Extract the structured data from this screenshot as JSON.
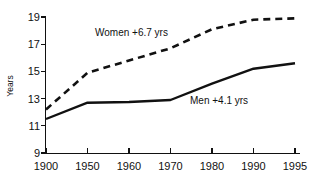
{
  "chart_data": {
    "type": "line",
    "title": "",
    "subtitle": "",
    "xlabel": "",
    "ylabel": "Years",
    "x": [
      "1900",
      "1950",
      "1960",
      "1970",
      "1980",
      "1990",
      "1995"
    ],
    "categories": [
      "1900",
      "1950",
      "1960",
      "1970",
      "1980",
      "1990",
      "1995"
    ],
    "xtick_labels": [
      "1900",
      "1950",
      "1960",
      "1970",
      "1980",
      "1990",
      "1995"
    ],
    "ytick_labels": [
      "9",
      "11",
      "13",
      "15",
      "17",
      "19"
    ],
    "yticks": [
      9,
      11,
      13,
      15,
      17,
      19
    ],
    "ylim": [
      9,
      19
    ],
    "grid": false,
    "legend_position": "inline-annotation",
    "series": [
      {
        "name": "Women",
        "style": "dashed",
        "color": "#111111",
        "annotation": "Women +6.7 yrs",
        "values": [
          12.2,
          14.9,
          15.8,
          16.7,
          18.1,
          18.8,
          18.9
        ]
      },
      {
        "name": "Men",
        "style": "solid",
        "color": "#111111",
        "annotation": "Men +4.1 yrs",
        "values": [
          11.5,
          12.7,
          12.75,
          12.9,
          14.1,
          15.2,
          15.6
        ]
      }
    ],
    "annotations": [
      {
        "id": "women-annotation",
        "text": "Women +6.7 yrs"
      },
      {
        "id": "men-annotation",
        "text": "Men +4.1 yrs"
      }
    ]
  },
  "axis": {
    "y_title": "Years",
    "y_labels": [
      "19",
      "17",
      "15",
      "13",
      "11",
      "9"
    ],
    "x_labels": [
      "1900",
      "1950",
      "1960",
      "1970",
      "1980",
      "1990",
      "1995"
    ]
  },
  "annotations": {
    "women": "Women +6.7 yrs",
    "men": "Men +4.1 yrs"
  },
  "colors": {
    "ink": "#111111",
    "background": "#ffffff"
  }
}
